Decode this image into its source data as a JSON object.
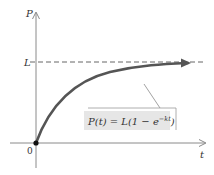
{
  "diagram": {
    "y_axis_label": "P",
    "x_axis_label": "t",
    "asymptote_label": "L",
    "origin_label": "0",
    "formula": {
      "prefix": "P(t) = L(1 − e",
      "exponent": "−kt",
      "suffix": ")"
    },
    "colors": {
      "axis": "#8a8a8a",
      "curve": "#555555",
      "dashed": "#666666",
      "label_box": "#e6e6e6",
      "label_box_border": "#9a9a9a"
    }
  }
}
